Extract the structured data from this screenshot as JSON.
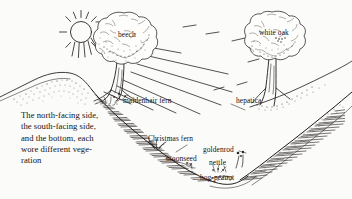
{
  "illustration": {
    "title": "Ravine cross-section with vegetation",
    "background_color": "#fbfbfa",
    "ink_color": "#1d1a17",
    "width": 352,
    "height": 199,
    "caption": {
      "lines": [
        "The north-facing side,",
        "the south-facing side,",
        "and the bottom, each",
        "wore different vege-",
        "ration"
      ]
    },
    "labels": [
      {
        "id": "beech",
        "text": "beech",
        "x": 118,
        "y": 35
      },
      {
        "id": "white-oak",
        "text": "white oak",
        "x": 259,
        "y": 33
      },
      {
        "id": "maidenhair-fern",
        "text": "maidenhair fern",
        "x": 123,
        "y": 101
      },
      {
        "id": "hepatica",
        "text": "hepatica",
        "x": 236,
        "y": 101
      },
      {
        "id": "christmas-fern",
        "text": "Christmas fern",
        "x": 148,
        "y": 139
      },
      {
        "id": "goldenrod",
        "text": "goldenrod",
        "x": 203,
        "y": 150
      },
      {
        "id": "moonseed",
        "text": "moonseed",
        "x": 166,
        "y": 159
      },
      {
        "id": "nettle",
        "text": "nettle",
        "x": 209,
        "y": 163
      },
      {
        "id": "hog-peanut",
        "text": "hog-peanut",
        "x": 200,
        "y": 178
      }
    ],
    "elements": {
      "sun": {
        "name": "sun",
        "cx": 81,
        "cy": 32,
        "r": 11,
        "rays": 12
      },
      "sun_rays_beam_count": 7,
      "trees": [
        {
          "id": "beech-tree",
          "name": "beech",
          "trunk_x": 120,
          "canopy_cx": 124,
          "canopy_cy": 40
        },
        {
          "id": "white-oak-tree",
          "name": "white oak",
          "trunk_x": 272,
          "canopy_cx": 274,
          "canopy_cy": 38
        }
      ],
      "slopes": [
        {
          "id": "north-facing-slope",
          "name": "north-facing side"
        },
        {
          "id": "south-facing-slope",
          "name": "south-facing side"
        },
        {
          "id": "ravine-bottom",
          "name": "the bottom"
        }
      ]
    }
  }
}
